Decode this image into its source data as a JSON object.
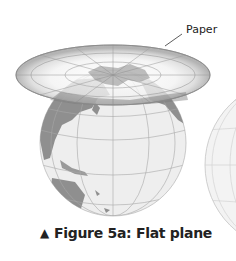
{
  "figure": {
    "label": "Paper",
    "caption": "Figure 5a: Flat plane",
    "caption_marker": "▲",
    "colors": {
      "land": "#8f8f8f",
      "ocean": "#eeeeee",
      "grid": "#a8a8a8",
      "plane_rim": "#b0b0b0",
      "plane_inner": "#f4f4f4",
      "text": "#222222"
    }
  }
}
